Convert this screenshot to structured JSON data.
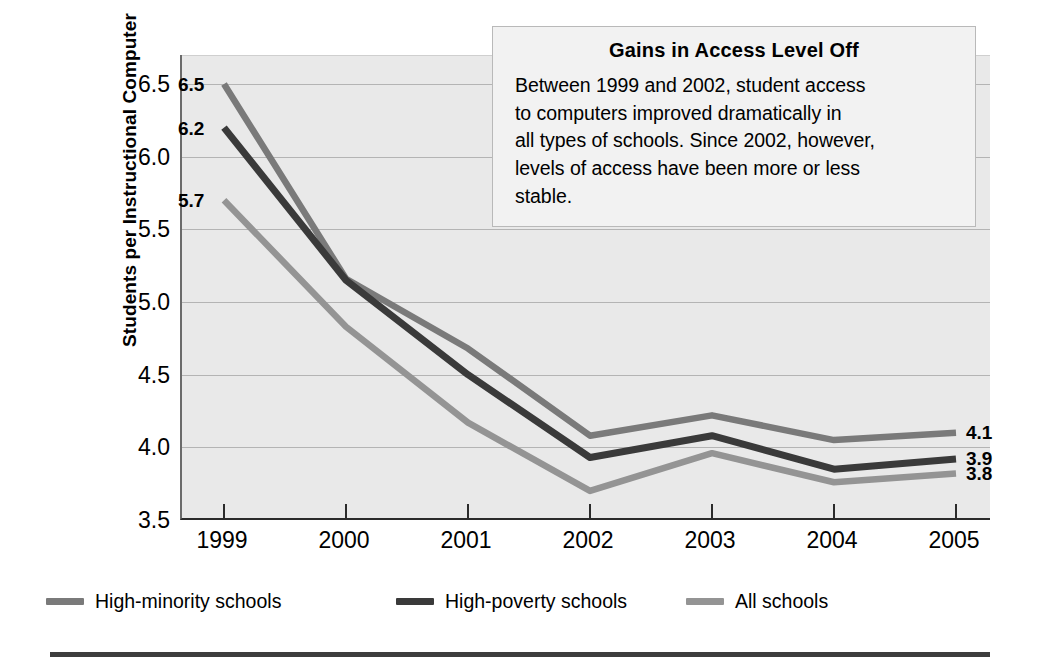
{
  "chart_data": {
    "type": "line",
    "title": "",
    "xlabel": "",
    "ylabel": "Students per Instructional Computer",
    "x": [
      "1999",
      "2000",
      "2001",
      "2002",
      "2003",
      "2004",
      "2005"
    ],
    "ylim": [
      3.5,
      6.7
    ],
    "yticks": [
      "3.5",
      "4.0",
      "4.5",
      "5.0",
      "5.5",
      "6.0",
      "6.5"
    ],
    "ytick_values": [
      3.5,
      4.0,
      4.5,
      5.0,
      5.5,
      6.0,
      6.5
    ],
    "grid": true,
    "legend_position": "below-plot",
    "series": [
      {
        "name": "High-minority schools",
        "color": "#7a7a7a",
        "values": [
          6.5,
          5.16,
          4.68,
          4.08,
          4.22,
          4.05,
          4.1
        ],
        "start_label": "6.5",
        "end_label": "4.1"
      },
      {
        "name": "High-poverty schools",
        "color": "#3a3a3a",
        "values": [
          6.2,
          5.15,
          4.5,
          3.93,
          4.08,
          3.85,
          3.92
        ],
        "start_label": "6.2",
        "end_label": "3.9"
      },
      {
        "name": "All schools",
        "color": "#949494",
        "values": [
          5.7,
          4.83,
          4.17,
          3.7,
          3.96,
          3.76,
          3.82
        ],
        "start_label": "5.7",
        "end_label": "3.8"
      }
    ],
    "annotations": [
      {
        "title": "Gains in Access Level Off",
        "text": "Between 1999 and 2002, student access to computers improved dramatically in all types of schools. Since 2002, however, levels of access have been more or less stable."
      }
    ]
  },
  "callout": {
    "title": "Gains in Access Level Off",
    "lines": [
      "Between 1999 and 2002, student access",
      "to computers improved dramatically in",
      "all types of schools. Since 2002, however,",
      "levels of access have been more or less",
      "stable."
    ]
  },
  "axis": {
    "y_title": "Students per Instructional Computer"
  },
  "colors": {
    "plot_background": "#e9e9e9",
    "gridline": "#b4b4b4",
    "axis": "#2b2b2b",
    "callout_background": "#f2f2f2",
    "callout_border": "#b9b9b9",
    "rule": "#3d3d3d"
  }
}
